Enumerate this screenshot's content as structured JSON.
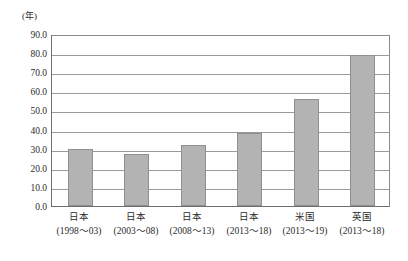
{
  "chart_data": {
    "type": "bar",
    "title": "",
    "subtitle": "",
    "unit_label": "(年)",
    "xlabel": "",
    "ylabel": "",
    "ylim": [
      0,
      90
    ],
    "ytick_step": 10,
    "grid": true,
    "legend": "none",
    "categories": [
      "日本\n(1998〜03)",
      "日本\n(2003〜08)",
      "日本\n(2008〜13)",
      "日本\n(2013〜18)",
      "米国\n(2013〜19)",
      "英国\n(2013〜18)"
    ],
    "category_names": [
      "日本",
      "日本",
      "日本",
      "日本",
      "米国",
      "英国"
    ],
    "category_periods": [
      "(1998〜03)",
      "(2003〜08)",
      "(2008〜13)",
      "(2013〜18)",
      "(2013〜19)",
      "(2013〜18)"
    ],
    "values": [
      30.0,
      27.0,
      32.0,
      38.0,
      56.0,
      79.0
    ],
    "ytick_labels": [
      "90.0",
      "80.0",
      "70.0",
      "60.0",
      "50.0",
      "40.0",
      "30.0",
      "20.0",
      "10.0",
      "0.0"
    ],
    "ytick_values": [
      90,
      80,
      70,
      60,
      50,
      40,
      30,
      20,
      10,
      0
    ],
    "bar_color": "#b3b3b3",
    "bar_border_color": "#8f8f8f",
    "grid_color": "#9a9a9a",
    "axis_color": "#6e6e6e",
    "background_color": "#ffffff"
  }
}
